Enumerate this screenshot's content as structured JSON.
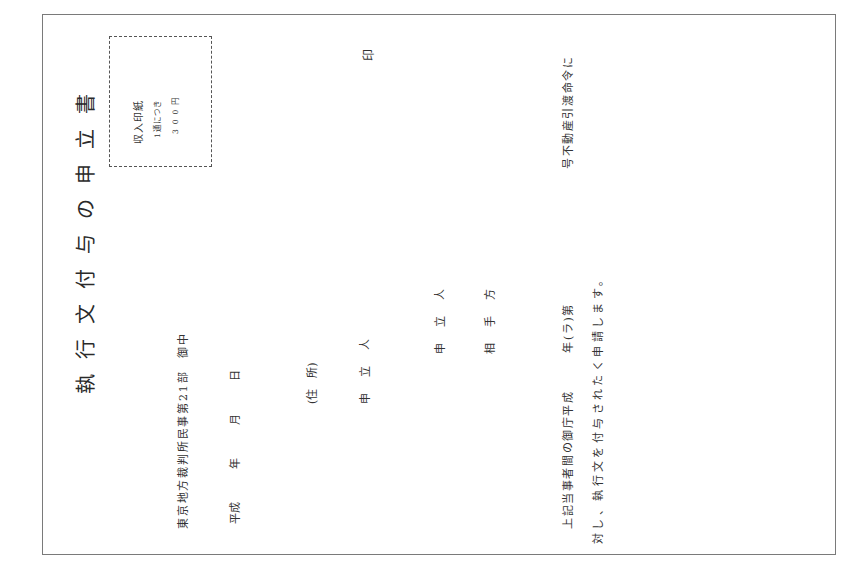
{
  "document": {
    "title": "執行文付与の申立書",
    "revenue_stamp": {
      "line1": "収入印紙",
      "line2": "1通につき",
      "line3": "300円"
    },
    "addressee": "東京地方裁判所民事第21部　御中",
    "date_line": "平成　　　年　　　月　　　日",
    "address_label": "(住　所)",
    "applicant_signature_label": "申立人",
    "seal_mark": "印",
    "parties": {
      "applicant_label": "申立人",
      "opponent_label": "相手方"
    },
    "body": {
      "line1_part1": "上記当事者間の御庁平成　　　年(ラ)第",
      "line1_part2": "号不動産引渡命令に",
      "line2": "対し、執行文を付与されたく申請します。"
    }
  }
}
